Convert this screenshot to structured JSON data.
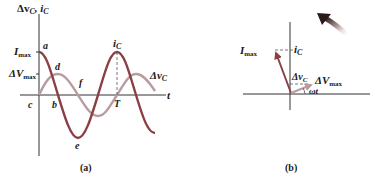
{
  "panel_a": {
    "caption": "(a)",
    "y_axis_label_main": "Δv",
    "y_axis_label_sub1": "C",
    "y_axis_label_sep": ", i",
    "y_axis_label_sub2": "C",
    "x_axis_label": "t",
    "tick_imax_main": "I",
    "tick_imax_sub": "max",
    "tick_vmax_main": "ΔV",
    "tick_vmax_sub": "max",
    "point_labels": {
      "a": "a",
      "b": "b",
      "c": "c",
      "d": "d",
      "e": "e",
      "f": "f",
      "T": "T"
    },
    "curve_current_label_main": "i",
    "curve_current_label_sub": "C",
    "curve_voltage_label_main": "Δv",
    "curve_voltage_label_sub": "C",
    "colors": {
      "current": "#8a3f45",
      "voltage": "#b89ca0",
      "axis": "#333333"
    }
  },
  "panel_b": {
    "caption": "(b)",
    "phasor_current_label_main": "I",
    "phasor_current_label_sub": "max",
    "projection_current_main": "i",
    "projection_current_sub": "C",
    "projection_voltage_main": "Δv",
    "projection_voltage_sub": "C",
    "phasor_voltage_label_main": "ΔV",
    "phasor_voltage_label_sub": "max",
    "angle_label": "ωt",
    "rotation_direction": "counterclockwise",
    "colors": {
      "current": "#8a3f45",
      "voltage": "#b89ca0",
      "arrow": "#2a1a1a"
    }
  }
}
